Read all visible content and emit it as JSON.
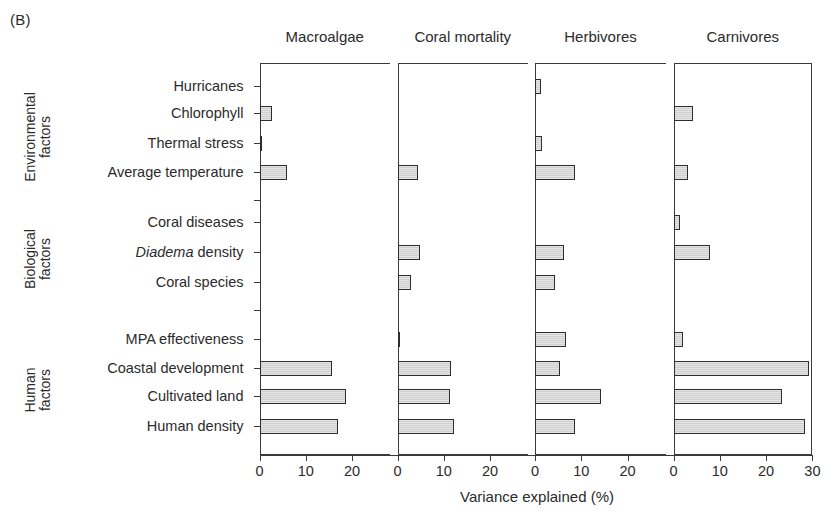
{
  "figure": {
    "panel_letter": "(B)",
    "xlabel": "Variance explained (%)"
  },
  "groups": [
    {
      "id": "environmental",
      "label_line1": "Environmental",
      "label_line2": "factors"
    },
    {
      "id": "biological",
      "label_line1": "Biological",
      "label_line2": "factors"
    },
    {
      "id": "human",
      "label_line1": "Human",
      "label_line2": "factors"
    }
  ],
  "panels": [
    {
      "id": "macroalgae",
      "title": "Macroalgae",
      "ticks": [
        0,
        10,
        20
      ]
    },
    {
      "id": "coral-mortality",
      "title": "Coral mortality",
      "ticks": [
        0,
        10,
        20
      ]
    },
    {
      "id": "herbivores",
      "title": "Herbivores",
      "ticks": [
        0,
        10,
        20
      ]
    },
    {
      "id": "carnivores",
      "title": "Carnivores",
      "ticks": [
        0,
        10,
        20,
        30
      ]
    }
  ],
  "categories": [
    {
      "label": "Hurricanes",
      "italic_prefix": "",
      "group": "environmental"
    },
    {
      "label": "Chlorophyll",
      "italic_prefix": "",
      "group": "environmental"
    },
    {
      "label": "Thermal stress",
      "italic_prefix": "",
      "group": "environmental"
    },
    {
      "label": "Average temperature",
      "italic_prefix": "",
      "group": "environmental"
    },
    {
      "label": "Coral diseases",
      "italic_prefix": "",
      "group": "biological"
    },
    {
      "label": "density",
      "italic_prefix": "Diadema",
      "group": "biological"
    },
    {
      "label": "Coral species",
      "italic_prefix": "",
      "group": "biological"
    },
    {
      "label": "MPA effectiveness",
      "italic_prefix": "",
      "group": "human"
    },
    {
      "label": "Coastal development",
      "italic_prefix": "",
      "group": "human"
    },
    {
      "label": "Cultivated land",
      "italic_prefix": "",
      "group": "human"
    },
    {
      "label": "Human density",
      "italic_prefix": "",
      "group": "human"
    }
  ],
  "chart_data": {
    "type": "bar",
    "title": "(B)",
    "xlabel": "Variance explained (%)",
    "ylabel": "",
    "orientation": "horizontal",
    "grid": false,
    "legend": "none",
    "panel_layout": "4 side-by-side panels sharing one y-axis of 11 categories grouped into Environmental / Biological / Human factors",
    "categories": [
      "Hurricanes",
      "Chlorophyll",
      "Thermal stress",
      "Average temperature",
      "Coral diseases",
      "Diadema density",
      "Coral species",
      "MPA effectiveness",
      "Coastal development",
      "Cultivated land",
      "Human density"
    ],
    "series": [
      {
        "name": "Macroalgae",
        "xlim": [
          0,
          25
        ],
        "ticks": [
          0,
          10,
          20
        ],
        "values": [
          0,
          2.7,
          0.4,
          6.0,
          0,
          0,
          0,
          0,
          15.7,
          18.6,
          17.0
        ]
      },
      {
        "name": "Coral mortality",
        "xlim": [
          0,
          25
        ],
        "ticks": [
          0,
          10,
          20
        ],
        "values": [
          0,
          0,
          0,
          4.5,
          0,
          4.8,
          2.9,
          0.3,
          11.6,
          11.3,
          12.3
        ]
      },
      {
        "name": "Herbivores",
        "xlim": [
          0,
          25
        ],
        "ticks": [
          0,
          10,
          20
        ],
        "values": [
          1.2,
          0,
          1.5,
          8.7,
          0,
          6.2,
          4.3,
          6.6,
          5.4,
          14.3,
          8.6
        ]
      },
      {
        "name": "Carnivores",
        "xlim": [
          0,
          30
        ],
        "ticks": [
          0,
          10,
          20,
          30
        ],
        "values": [
          0,
          4.3,
          0,
          3.2,
          1.5,
          7.8,
          0,
          2.0,
          29.3,
          23.4,
          28.3
        ]
      }
    ]
  }
}
